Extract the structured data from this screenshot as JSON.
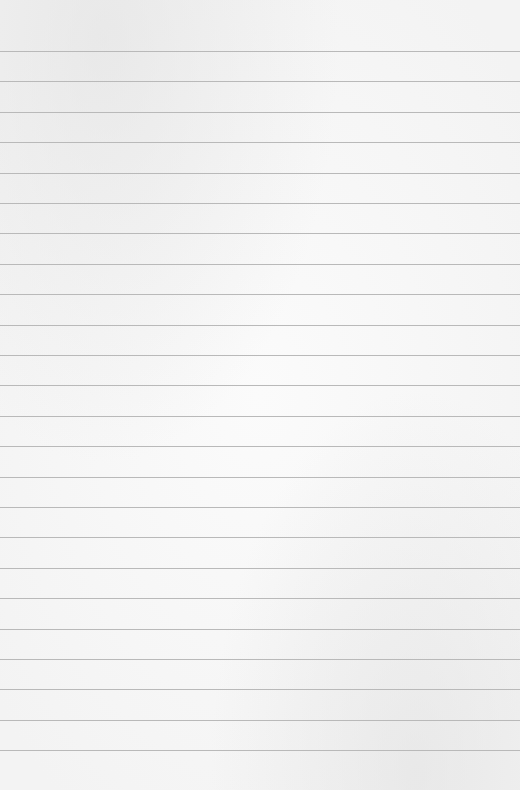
{
  "page": {
    "type": "lined-paper",
    "background_color": "#f7f7f7",
    "rule_color": "#b9b9b9",
    "first_rule_y": 51,
    "rule_spacing": 30.4,
    "rule_count": 24
  }
}
